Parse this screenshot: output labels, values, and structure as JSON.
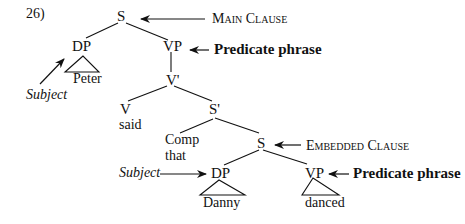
{
  "example_number": "26)",
  "tree": {
    "root": "S",
    "main_dp": "DP",
    "main_dp_word": "Peter",
    "main_vp": "VP",
    "v_bar": "V'",
    "verb": "V",
    "verb_word": "said",
    "s_bar": "S'",
    "comp": "Comp",
    "comp_word": "that",
    "embedded_s": "S",
    "embedded_dp": "DP",
    "embedded_dp_word": "Danny",
    "embedded_vp": "VP",
    "embedded_vp_word": "danced"
  },
  "annotations": {
    "main_clause": "Main Clause",
    "predicate_phrase_1": "Predicate phrase",
    "subject_1": "Subject",
    "embedded_clause": "Embedded Clause",
    "subject_2": "Subject",
    "predicate_phrase_2": "Predicate phrase"
  }
}
